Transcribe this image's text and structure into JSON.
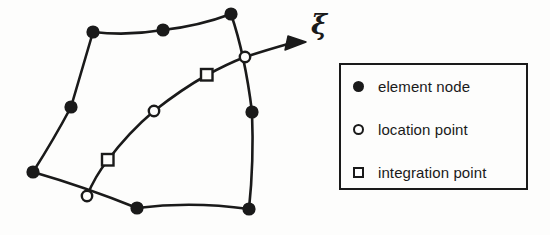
{
  "figure": {
    "title": "",
    "background_color": "#fdfdfc",
    "ink_color": "#1a1a1a",
    "axis_label": "ξ"
  },
  "legend": {
    "items": [
      {
        "symbol": "filled-circle",
        "label": "element node"
      },
      {
        "symbol": "open-circle",
        "label": "location point"
      },
      {
        "symbol": "open-square",
        "label": "integration point"
      }
    ]
  },
  "diagram_data": {
    "type": "diagram",
    "description": "Curved quadrilateral finite element with nodes, and an interior xi-direction curve carrying location points and integration points, terminating in an arrow labelled xi.",
    "element_nodes": [
      {
        "name": "corner-top-left",
        "x": 93,
        "y": 32
      },
      {
        "name": "midside-top",
        "x": 163,
        "y": 30
      },
      {
        "name": "corner-top-right",
        "x": 231,
        "y": 14
      },
      {
        "name": "midside-right",
        "x": 252,
        "y": 112
      },
      {
        "name": "corner-bottom-right",
        "x": 249,
        "y": 209
      },
      {
        "name": "midside-bottom",
        "x": 137,
        "y": 208
      },
      {
        "name": "corner-bottom-left",
        "x": 33,
        "y": 172
      },
      {
        "name": "midside-left",
        "x": 71,
        "y": 107
      }
    ],
    "location_points": [
      {
        "name": "location-point-start",
        "x": 87,
        "y": 196
      },
      {
        "name": "location-point-mid",
        "x": 154,
        "y": 111
      },
      {
        "name": "location-point-end",
        "x": 245,
        "y": 57
      }
    ],
    "integration_points": [
      {
        "name": "integration-point-lower",
        "x": 108,
        "y": 160
      },
      {
        "name": "integration-point-upper",
        "x": 207,
        "y": 75
      }
    ],
    "xi_arrow": {
      "from_x": 245,
      "from_y": 57,
      "tip_x": 306,
      "tip_y": 42
    },
    "element_boundary_path": "M 93 32 Q 128 36 163 30 Q 199 26 231 14 Q 245 55 252 112 Q 254 162 249 209 Q 192 201 137 208 Q 85 187 33 172 Q 54 139 71 107 Q 82 69 93 32 Z",
    "xi_curve_path": "M 87 196 Q 95 176 108 160 Q 128 133 154 111 Q 182 89 207 75 Q 227 64 245 57"
  }
}
